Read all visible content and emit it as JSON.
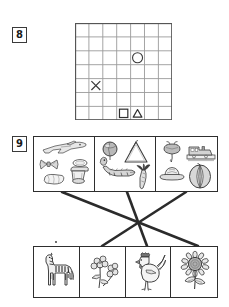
{
  "page": {
    "background_color": "#ffffff",
    "ink_color": "#2b2b2b"
  },
  "tasks": [
    {
      "number": "8",
      "type": "grid-plot",
      "grid": {
        "columns": 7,
        "rows": 7,
        "cell_size_px": 13.9,
        "border_color": "#555555",
        "line_color": "#9a9a9a",
        "marks": [
          {
            "symbol": "circle",
            "glyph": "○",
            "col": 5,
            "row": 3,
            "name": "circle-mark"
          },
          {
            "symbol": "cross",
            "glyph": "✕",
            "col": 2,
            "row": 5,
            "name": "cross-mark"
          },
          {
            "symbol": "square",
            "glyph": "□",
            "col": 4,
            "row": 7,
            "name": "square-mark"
          },
          {
            "symbol": "triangle",
            "glyph": "△",
            "col": 5,
            "row": 7,
            "name": "triangle-mark"
          }
        ]
      }
    },
    {
      "number": "9",
      "type": "picture-matching",
      "top_row": {
        "name": "top-picture-row",
        "cells": [
          {
            "id": "top-1",
            "label": "group-airplane-bowtie-bread-mortar",
            "items": [
              {
                "icon": "airplane-icon",
                "label": "airplane"
              },
              {
                "icon": "bowtie-icon",
                "label": "bow tie"
              },
              {
                "icon": "bread-icon",
                "label": "bread loaf"
              },
              {
                "icon": "mortar-icon",
                "label": "mortar and pestle"
              }
            ]
          },
          {
            "id": "top-2",
            "label": "group-ball-triangle-crocodile-carrot",
            "items": [
              {
                "icon": "ball-icon",
                "label": "ball"
              },
              {
                "icon": "triangle-instrument-icon",
                "label": "triangle instrument"
              },
              {
                "icon": "crocodile-icon",
                "label": "crocodile"
              },
              {
                "icon": "carrot-icon",
                "label": "carrot"
              }
            ]
          },
          {
            "id": "top-3",
            "label": "group-beet-train-hat-melon",
            "items": [
              {
                "icon": "beet-icon",
                "label": "beetroot"
              },
              {
                "icon": "train-icon",
                "label": "train"
              },
              {
                "icon": "hat-icon",
                "label": "hat"
              },
              {
                "icon": "melon-icon",
                "label": "melon"
              }
            ]
          }
        ]
      },
      "bottom_row": {
        "name": "bottom-picture-row",
        "cells": [
          {
            "id": "bottom-1",
            "icon": "zebra-icon",
            "label": "zebra"
          },
          {
            "id": "bottom-2",
            "icon": "flowers-icon",
            "label": "flowers"
          },
          {
            "id": "bottom-3",
            "icon": "rooster-icon",
            "label": "rooster"
          },
          {
            "id": "bottom-4",
            "icon": "sunflower-icon",
            "label": "sunflower"
          }
        ]
      },
      "connections": [
        {
          "name": "line-top1-to-bottom4",
          "from": "top-1",
          "to": "bottom-4",
          "x1": 62,
          "y1": 62,
          "x2": 198,
          "y2": 116
        },
        {
          "name": "line-top2-to-bottom3",
          "from": "top-2",
          "to": "bottom-3",
          "x1": 127,
          "y1": 62,
          "x2": 147,
          "y2": 116
        },
        {
          "name": "line-top3-to-bottom2",
          "from": "top-3",
          "to": "bottom-2",
          "x1": 186,
          "y1": 62,
          "x2": 102,
          "y2": 116
        }
      ],
      "stray_dot": {
        "name": "stray-dot",
        "x": 56,
        "y": 112
      }
    }
  ]
}
